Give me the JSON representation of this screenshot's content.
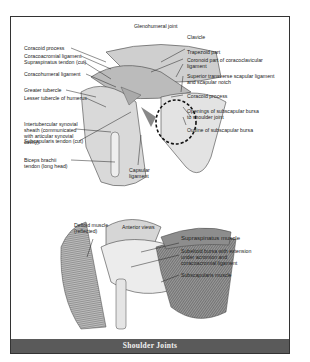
{
  "title": "Shoulder Joints",
  "upper_figure": {
    "labels_left": [
      "Coracoid process",
      "Coracoacromial ligament",
      "Supraspinatus tendon (cut)",
      "Coracohumeral ligament",
      "Greater tubercle",
      "Lesser tubercle of humerus",
      "Intertubercular synovial sheath (communicated with articular synovial cavity)",
      "Subcapularis tendon (cut)",
      "Biceps brachii tendon (long head)"
    ],
    "labels_top": [
      "Glenohumeral joint"
    ],
    "labels_right": [
      "Clavicle",
      "Trapezoid part",
      "Coronoid part of coracoclavicular ligament",
      "Superior transverse scapular ligament and scapular notch",
      "Coracoid process",
      "Openings of subscapular bursa to shoulder joint",
      "Outline of subscapular bursa"
    ],
    "labels_bottom": [
      "Capsular ligament"
    ]
  },
  "lower_figure": {
    "labels_top": [
      "Deltoid muscle (reflected)",
      "Anterior views"
    ],
    "labels_right": [
      "Supraspinatus muscle",
      "Subeltoid bursa with extension under acromion and coracoacromial ligament",
      "Subscapularis muscle"
    ]
  }
}
